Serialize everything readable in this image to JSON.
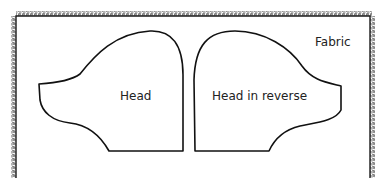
{
  "diagram": {
    "fabric": {
      "label": "Fabric",
      "edge_color": "#1a1a1a"
    },
    "pieces": [
      {
        "id": "head",
        "label": "Head"
      },
      {
        "id": "head-reverse",
        "label": "Head in reverse"
      }
    ],
    "outline_color": "#111111"
  }
}
